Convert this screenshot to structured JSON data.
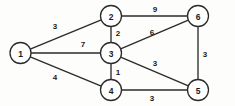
{
  "figure": {
    "name": "weighted-undirected-graph",
    "background_color": "#fdfdfc",
    "stroke_color": "#2b2b2b",
    "node_fill_color": "#ffffff",
    "text_color": "#1a1a1a"
  },
  "chart_data": {
    "type": "diagram",
    "title": "",
    "xlabel": "",
    "ylabel": "",
    "graph_kind": "weighted undirected graph",
    "node_radius": 10.5,
    "nodes": [
      {
        "id": "1",
        "label": "1",
        "x": 20.5,
        "y": 53
      },
      {
        "id": "2",
        "label": "2",
        "x": 111,
        "y": 16
      },
      {
        "id": "3",
        "label": "3",
        "x": 111,
        "y": 53
      },
      {
        "id": "4",
        "label": "4",
        "x": 111,
        "y": 90
      },
      {
        "id": "5",
        "label": "5",
        "x": 198,
        "y": 90
      },
      {
        "id": "6",
        "label": "6",
        "x": 198,
        "y": 16
      }
    ],
    "edges": [
      {
        "source": "1",
        "target": "2",
        "weight": "3",
        "label_x": 55,
        "label_y": 26
      },
      {
        "source": "1",
        "target": "3",
        "weight": "7",
        "label_x": 83,
        "label_y": 44
      },
      {
        "source": "1",
        "target": "4",
        "weight": "4",
        "label_x": 55,
        "label_y": 77
      },
      {
        "source": "2",
        "target": "3",
        "weight": "2",
        "label_x": 118,
        "label_y": 33
      },
      {
        "source": "2",
        "target": "6",
        "weight": "9",
        "label_x": 155,
        "label_y": 9
      },
      {
        "source": "3",
        "target": "6",
        "weight": "6",
        "label_x": 152,
        "label_y": 32
      },
      {
        "source": "3",
        "target": "5",
        "weight": "3",
        "label_x": 155,
        "label_y": 63
      },
      {
        "source": "3",
        "target": "4",
        "weight": "1",
        "label_x": 118,
        "label_y": 72
      },
      {
        "source": "4",
        "target": "5",
        "weight": "3",
        "label_x": 152,
        "label_y": 98
      },
      {
        "source": "6",
        "target": "5",
        "weight": "3",
        "label_x": 205,
        "label_y": 54
      }
    ]
  }
}
